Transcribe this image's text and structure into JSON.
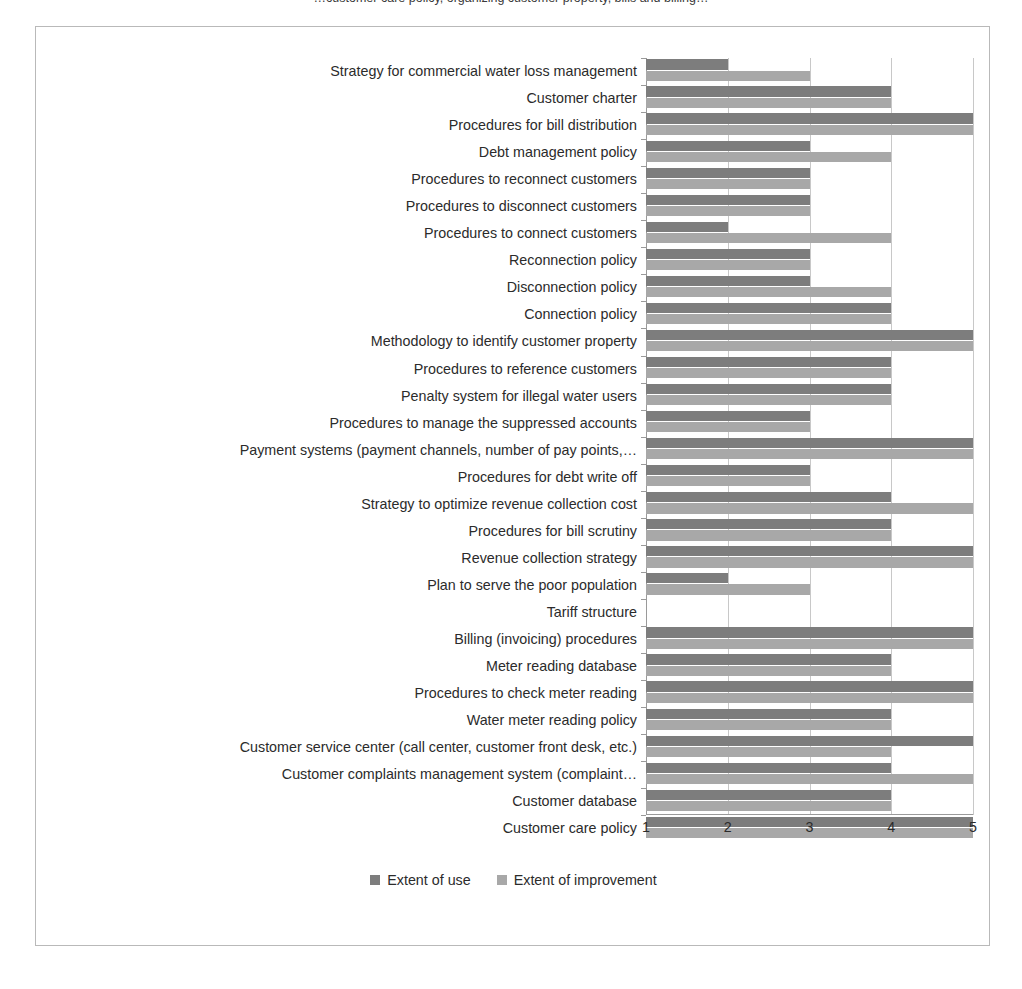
{
  "clipped_caption": "…customer care policy, organizing customer property, bills and billing…",
  "chart_data": {
    "type": "bar",
    "orientation": "horizontal",
    "title": "",
    "xlabel": "",
    "ylabel": "",
    "xlim": [
      1,
      5
    ],
    "xticks": [
      "1",
      "2",
      "3",
      "4",
      "5"
    ],
    "grid": true,
    "legend_position": "bottom",
    "colors": {
      "extent_of_use": "#7d7d7d",
      "extent_of_improvement": "#a8a8a8",
      "gridline": "#c8c8c8",
      "axis": "#9a9a9a",
      "frame": "#b9b9b9",
      "text": "#2b2b2b"
    },
    "series": [
      {
        "name": "Extent of use",
        "key": "use"
      },
      {
        "name": "Extent of improvement",
        "key": "improve"
      }
    ],
    "categories": [
      "Strategy for commercial water loss management",
      "Customer charter",
      "Procedures for bill distribution",
      "Debt management policy",
      "Procedures to reconnect customers",
      "Procedures to disconnect customers",
      "Procedures to connect customers",
      "Reconnection policy",
      "Disconnection policy",
      "Connection policy",
      "Methodology to identify customer property",
      "Procedures to reference customers",
      "Penalty system  for illegal water users",
      "Procedures to manage the suppressed accounts",
      "Payment systems (payment channels, number of pay points,…",
      "Procedures for debt write off",
      "Strategy to optimize revenue collection cost",
      "Procedures for bill scrutiny",
      "Revenue collection strategy",
      "Plan to serve the poor population",
      "Tariff structure",
      "Billing (invoicing) procedures",
      "Meter reading database",
      "Procedures to check meter reading",
      "Water meter reading policy",
      "Customer service center (call center, customer front desk, etc.)",
      "Customer complaints management system (complaint…",
      "Customer database",
      "Customer care policy"
    ],
    "values": {
      "use": [
        2,
        4,
        5,
        3,
        3,
        3,
        2,
        3,
        3,
        4,
        5,
        4,
        4,
        3,
        5,
        3,
        4,
        4,
        5,
        2,
        0,
        5,
        4,
        5,
        4,
        5,
        4,
        4,
        5
      ],
      "improve": [
        3,
        4,
        5,
        4,
        3,
        3,
        4,
        3,
        4,
        4,
        5,
        4,
        4,
        3,
        5,
        3,
        5,
        4,
        5,
        3,
        0,
        5,
        4,
        5,
        4,
        4,
        5,
        4,
        5
      ]
    }
  }
}
